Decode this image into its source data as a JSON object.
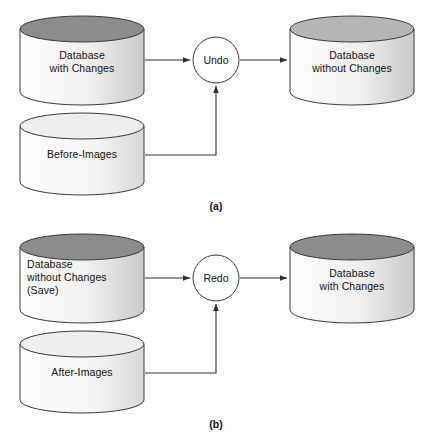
{
  "figure": {
    "type": "diagram",
    "panels": [
      {
        "id": "a",
        "caption": "(a)",
        "process": "Undo",
        "nodes": [
          {
            "id": "db-with-changes",
            "label": "Database\nwith Changes",
            "align": "center",
            "top_shade": "dark"
          },
          {
            "id": "before-images",
            "label": "Before-Images",
            "align": "center",
            "top_shade": "light"
          },
          {
            "id": "db-without-changes",
            "label": "Database\nwithout Changes",
            "align": "center",
            "top_shade": "medium"
          }
        ],
        "edges": [
          {
            "from": "db-with-changes",
            "to": "Undo"
          },
          {
            "from": "before-images",
            "to": "Undo"
          },
          {
            "from": "Undo",
            "to": "db-without-changes"
          }
        ]
      },
      {
        "id": "b",
        "caption": "(b)",
        "process": "Redo",
        "nodes": [
          {
            "id": "db-without-changes-save",
            "label": "Database\nwithout Changes\n(Save)",
            "align": "left",
            "top_shade": "dark"
          },
          {
            "id": "after-images",
            "label": "After-Images",
            "align": "center",
            "top_shade": "light"
          },
          {
            "id": "db-with-changes-2",
            "label": "Database\nwith Changes",
            "align": "center",
            "top_shade": "dark"
          }
        ],
        "edges": [
          {
            "from": "db-without-changes-save",
            "to": "Redo"
          },
          {
            "from": "after-images",
            "to": "Redo"
          },
          {
            "from": "Redo",
            "to": "db-with-changes-2"
          }
        ]
      }
    ]
  },
  "colors": {
    "stroke": "#3a3a3a",
    "top_dark": "#8c8c8c",
    "top_medium": "#b5b5b5",
    "top_light": "#e9e9e7",
    "body_light": "#fdfdfc",
    "body_dark": "#c9c9c7",
    "background": "#ffffff",
    "text": "#15110f"
  }
}
